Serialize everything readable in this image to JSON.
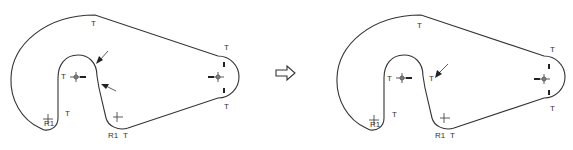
{
  "diagram": {
    "colors": {
      "line": "#333333",
      "background": "#ffffff"
    },
    "transition_arrow": {
      "icon": "hollow-right-arrow-icon"
    },
    "before": {
      "labels": {
        "tangent_top": "T",
        "tangent_inner_left": "T",
        "tangent_inner_bottom": "T",
        "tangent_right_top": "T",
        "tangent_right_bottom": "T",
        "tangent_bottom": "T",
        "radius_left": "R1",
        "radius_right": "R1"
      },
      "arrows": [
        "inner-arc-top-right-arrow",
        "inner-slot-right-arrow"
      ]
    },
    "after": {
      "labels": {
        "tangent_top": "T",
        "tangent_inner_left": "T",
        "tangent_inner_right": "T",
        "tangent_inner_bottom": "T",
        "tangent_right_top": "T",
        "tangent_right_bottom": "T",
        "tangent_bottom": "T",
        "radius_left": "R1",
        "radius_right": "R1"
      },
      "arrows": [
        "inner-slot-right-arrow"
      ]
    }
  }
}
